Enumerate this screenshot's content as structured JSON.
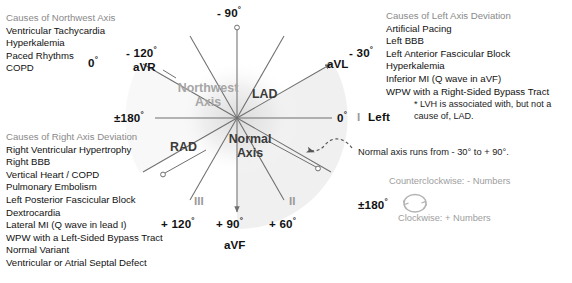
{
  "panels": {
    "northwest": {
      "heading": "Causes of Northwest Axis",
      "items": [
        "Ventricular Tachycardia",
        "Hyperkalemia",
        "Paced Rhythms",
        "COPD"
      ]
    },
    "lad": {
      "heading": "Causes of Left Axis Deviation",
      "items": [
        "Artificial Pacing",
        "Left BBB",
        "Left Anterior Fascicular Block",
        "Hyperkalemia",
        "Inferior MI (Q wave in aVF)",
        "WPW with a Right-Sided Bypass Tract"
      ],
      "footnote_line1": "* LVH is associated with, but not a",
      "footnote_line2": "cause of, LAD."
    },
    "rad": {
      "heading": "Causes of Right Axis Deviation",
      "items": [
        "Right Ventricular Hypertrophy",
        "Right BBB",
        "Vertical Heart / COPD",
        "Pulmonary Embolism",
        "Left Posterior Fascicular Block",
        "Dextrocardia",
        "Lateral MI (Q wave in lead I)",
        "WPW with a Left-Sided Bypass Tract",
        "Normal Variant",
        "Ventricular or Atrial Septal Defect"
      ]
    }
  },
  "diagram": {
    "angles": {
      "minus90": "- 90",
      "minus120": "- 120",
      "minus30": "- 30",
      "zero": "0",
      "plus180": "±180",
      "plus120": "+ 120",
      "plus90": "+ 90",
      "plus60": "+ 60"
    },
    "degree_symbol": "°",
    "leads": {
      "aVR": "aVR",
      "aVL": "aVL",
      "aVF": "aVF",
      "I": "I",
      "II": "II",
      "III": "III"
    },
    "zones": {
      "northwest_line1": "Northwest",
      "northwest_line2": "Axis",
      "lad": "LAD",
      "rad": "RAD",
      "normal_line1": "Normal",
      "normal_line2": "Axis"
    },
    "labels": {
      "left": "Left",
      "normal_range_note": "Normal axis runs from - 30° to + 90°.",
      "counterclockwise": "Counterclockwise: - Numbers",
      "clockwise": "Clockwise: + Numbers",
      "rotation_center": "±180"
    }
  },
  "colors": {
    "axis_line": "#6f6f6f",
    "text_dark": "#111111",
    "text_gray": "#9a9a9a",
    "heading_gray": "#8a8a8a",
    "wedge_shade": "#e9e9e9",
    "background": "#ffffff"
  }
}
